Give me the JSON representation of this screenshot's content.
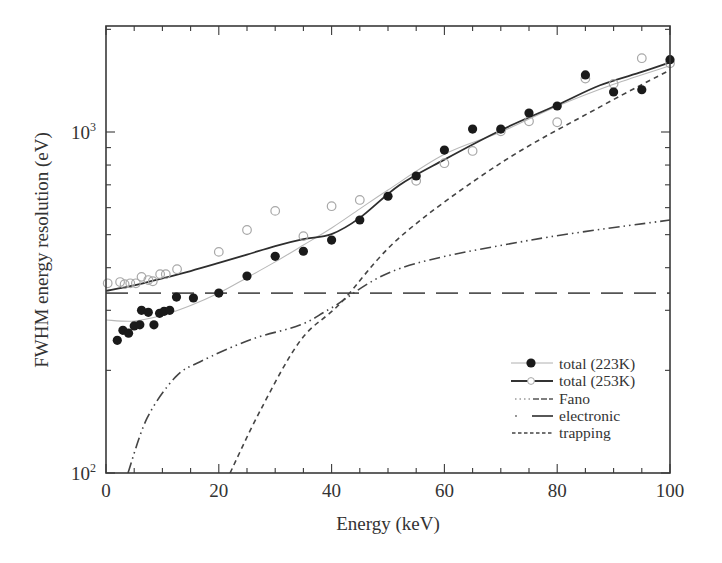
{
  "chart_data": {
    "type": "scatter",
    "title": "",
    "xlabel": "Energy (keV)",
    "ylabel": "FWHM energy resolution (eV)",
    "xlim": [
      0,
      100
    ],
    "ylim": [
      100,
      2050
    ],
    "yscale": "log",
    "grid": false,
    "legend_position": "lower right",
    "x_ticks": [
      0,
      20,
      40,
      60,
      80,
      100
    ],
    "x_tick_labels": [
      "0",
      "20",
      "40",
      "60",
      "80",
      "100"
    ],
    "y_ticks": [
      100,
      1000
    ],
    "y_tick_labels": [
      {
        "base": "10",
        "exp": "2"
      },
      {
        "base": "10",
        "exp": "3"
      }
    ],
    "series": [
      {
        "name": "total (223K)",
        "kind": "markers+fit",
        "marker": "filled-circle",
        "points": [
          [
            2,
            245
          ],
          [
            3,
            262
          ],
          [
            4,
            257
          ],
          [
            5,
            270
          ],
          [
            6,
            272
          ],
          [
            6.3,
            300
          ],
          [
            7.5,
            296
          ],
          [
            8.5,
            272
          ],
          [
            9.5,
            294
          ],
          [
            10.3,
            298
          ],
          [
            11.3,
            300
          ],
          [
            12.5,
            328
          ],
          [
            15.5,
            326
          ],
          [
            20,
            337
          ],
          [
            25,
            378
          ],
          [
            30,
            432
          ],
          [
            35,
            447
          ],
          [
            40,
            482
          ],
          [
            45,
            552
          ],
          [
            50,
            648
          ],
          [
            55,
            743
          ],
          [
            60,
            885
          ],
          [
            65,
            1020
          ],
          [
            70,
            1020
          ],
          [
            75,
            1137
          ],
          [
            80,
            1192
          ],
          [
            85,
            1470
          ],
          [
            90,
            1310
          ],
          [
            95,
            1330
          ],
          [
            100,
            1630
          ]
        ],
        "fit": [
          [
            0,
            281
          ],
          [
            5,
            279
          ],
          [
            10,
            290
          ],
          [
            15,
            310
          ],
          [
            20,
            337
          ],
          [
            25,
            374
          ],
          [
            30,
            416
          ],
          [
            35,
            466
          ],
          [
            40,
            523
          ],
          [
            45,
            595
          ],
          [
            50,
            676
          ],
          [
            60,
            860
          ],
          [
            70,
            1000
          ],
          [
            80,
            1190
          ],
          [
            90,
            1380
          ],
          [
            100,
            1565
          ]
        ]
      },
      {
        "name": "total (253K)",
        "kind": "markers+fit",
        "marker": "open-circle",
        "points": [
          [
            0.3,
            360
          ],
          [
            2.5,
            363
          ],
          [
            3.3,
            358
          ],
          [
            4.3,
            360
          ],
          [
            5.3,
            360
          ],
          [
            6.3,
            376
          ],
          [
            7.5,
            368
          ],
          [
            8.3,
            365
          ],
          [
            9.6,
            383
          ],
          [
            10.6,
            383
          ],
          [
            12.6,
            396
          ],
          [
            20,
            445
          ],
          [
            25,
            516
          ],
          [
            30,
            587
          ],
          [
            35,
            495
          ],
          [
            40,
            606
          ],
          [
            45,
            632
          ],
          [
            55,
            719
          ],
          [
            60,
            810
          ],
          [
            65,
            880
          ],
          [
            70,
            1005
          ],
          [
            75,
            1075
          ],
          [
            80,
            1068
          ],
          [
            85,
            1434
          ],
          [
            90,
            1384
          ],
          [
            95,
            1646
          ],
          [
            100,
            1590
          ]
        ],
        "fit": [
          [
            0,
            342
          ],
          [
            5,
            355
          ],
          [
            10,
            372
          ],
          [
            15,
            391
          ],
          [
            20,
            413
          ],
          [
            25,
            437
          ],
          [
            30,
            463
          ],
          [
            35,
            485
          ],
          [
            40,
            502
          ],
          [
            45,
            560
          ],
          [
            52,
            698
          ],
          [
            60,
            830
          ],
          [
            70,
            1012
          ],
          [
            80,
            1200
          ],
          [
            87.6,
            1371
          ],
          [
            95,
            1500
          ],
          [
            100,
            1600
          ]
        ]
      },
      {
        "name": "Fano",
        "kind": "line",
        "style": "long-dash",
        "points": [
          [
            0,
            337
          ],
          [
            100,
            337
          ]
        ]
      },
      {
        "name": "electronic",
        "kind": "line",
        "style": "dash-dot",
        "points": [
          [
            3.9,
            100
          ],
          [
            7.3,
            145
          ],
          [
            12.3,
            191
          ],
          [
            16.7,
            212
          ],
          [
            25.6,
            246
          ],
          [
            34.5,
            272
          ],
          [
            40,
            305
          ],
          [
            52.3,
            399
          ],
          [
            75.3,
            482
          ],
          [
            100,
            552
          ]
        ]
      },
      {
        "name": "trapping",
        "kind": "line",
        "style": "short-dash",
        "points": [
          [
            22,
            100
          ],
          [
            27.4,
            153
          ],
          [
            34.5,
            245
          ],
          [
            41.6,
            315
          ],
          [
            52.2,
            493
          ],
          [
            70,
            811
          ],
          [
            87.6,
            1185
          ],
          [
            100,
            1520
          ]
        ]
      }
    ]
  },
  "legend": {
    "items": [
      {
        "label": "total (223K)"
      },
      {
        "label": "total (253K)"
      },
      {
        "label": "Fano"
      },
      {
        "label": "electronic"
      },
      {
        "label": "trapping"
      }
    ]
  },
  "axes": {
    "xlabel": "Energy (keV)",
    "ylabel": "FWHM energy resolution (eV)"
  },
  "colors": {
    "ink": "#2a2a2a",
    "fit_light": "#b0b0b0",
    "marker_open": "#a8a8a8"
  }
}
